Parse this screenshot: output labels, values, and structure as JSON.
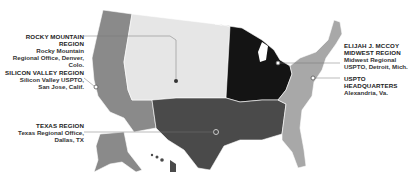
{
  "map": {
    "title": "USPTO Regional Offices Map",
    "colors": {
      "west_region": "#8a8a8a",
      "rocky_mountain_region": "#e6e6e6",
      "midwest_region": "#141414",
      "texas_region": "#4a4a4a",
      "east_region": "#a8a8a8",
      "border": "#ffffff",
      "leader_line": "#666666"
    },
    "regions": [
      {
        "id": "rocky",
        "title": "ROCKY MOUNTAIN REGION",
        "lines": [
          "Rocky Mountain",
          "Regional Office, Denver, Colo."
        ]
      },
      {
        "id": "silicon",
        "title": "SILICON VALLEY REGION",
        "lines": [
          "Silicon Valley USPTO,",
          "San Jose, Calif."
        ]
      },
      {
        "id": "texas",
        "title": "TEXAS REGION",
        "lines": [
          "Texas Regional Office,",
          "Dallas, TX"
        ]
      },
      {
        "id": "midwest",
        "title": "ELIJAH J. MCCOY",
        "title2": "MIDWEST REGION",
        "lines": [
          "Midwest Regional",
          "USPTO, Detroit, Mich."
        ]
      },
      {
        "id": "hq",
        "title": "USPTO HEADQUARTERS",
        "lines": [
          "Alexandria, Va."
        ]
      }
    ]
  }
}
